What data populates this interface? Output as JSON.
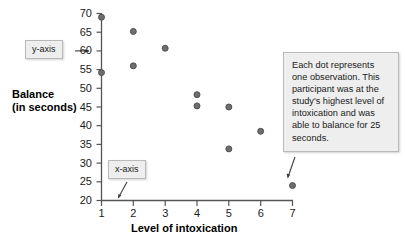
{
  "chart_data": {
    "type": "scatter",
    "title": "",
    "xlabel": "Level of intoxication",
    "ylabel": "Balance (in seconds)",
    "ylabel_lines": [
      "Balance",
      "(in seconds)"
    ],
    "xlim": [
      1,
      7
    ],
    "ylim": [
      20,
      70
    ],
    "grid": false,
    "legend": null,
    "x_ticks": [
      "1",
      "2",
      "3",
      "4",
      "5",
      "6",
      "7"
    ],
    "y_ticks": [
      "20",
      "25",
      "30",
      "35",
      "40",
      "45",
      "50",
      "55",
      "60",
      "65",
      "70"
    ],
    "marker_color": "#6e6e6e",
    "marker_edge_color": "#4a4a4a",
    "axis_color": "#555555",
    "points": [
      {
        "x": 1,
        "y": 69.0
      },
      {
        "x": 1,
        "y": 54.2
      },
      {
        "x": 2,
        "y": 65.2
      },
      {
        "x": 2,
        "y": 56.0
      },
      {
        "x": 3,
        "y": 60.7
      },
      {
        "x": 4,
        "y": 48.3
      },
      {
        "x": 4,
        "y": 45.3
      },
      {
        "x": 5,
        "y": 45.0
      },
      {
        "x": 5,
        "y": 33.8
      },
      {
        "x": 6,
        "y": 38.5
      },
      {
        "x": 7,
        "y": 24.0
      }
    ]
  },
  "annotations": {
    "y_axis_label": "y-axis",
    "x_axis_label": "x-axis",
    "note": "Each dot represents one observation. This participant was at the study's highest level of intoxication and was able to balance for 25 seconds."
  }
}
